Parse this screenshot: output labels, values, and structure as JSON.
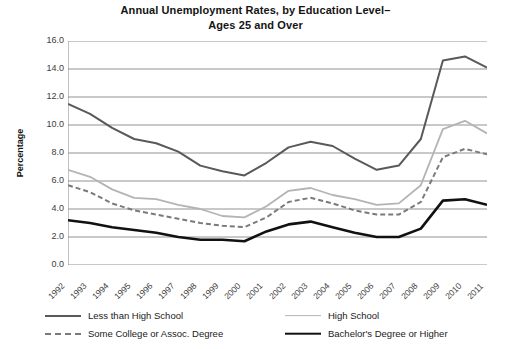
{
  "chart_data": {
    "type": "line",
    "title": "Annual Unemployment Rates, by Education Level– Ages 25 and Over",
    "title_line1": "Annual Unemployment Rates, by Education Level–",
    "title_line2": "Ages 25 and Over",
    "xlabel": "",
    "ylabel": "Percentage",
    "ylim": [
      0.0,
      16.0
    ],
    "ytick_step": 2.0,
    "grid": "horizontal",
    "legend_position": "bottom",
    "yticks": [
      "16.0",
      "14.0",
      "12.0",
      "10.0",
      "8.0",
      "6.0",
      "4.0",
      "2.0",
      "0.0"
    ],
    "categories": [
      "1992",
      "1993",
      "1994",
      "1995",
      "1996",
      "1997",
      "1998",
      "1999",
      "2000",
      "2001",
      "2002",
      "2003",
      "2004",
      "2005",
      "2006",
      "2007",
      "2008",
      "2009",
      "2010",
      "2011"
    ],
    "series": [
      {
        "name": "Less than High School",
        "color": "#595959",
        "style": "solid",
        "width": 2.0,
        "values": [
          11.5,
          10.8,
          9.8,
          9.0,
          8.7,
          8.1,
          7.1,
          6.7,
          6.4,
          7.3,
          8.4,
          8.8,
          8.5,
          7.6,
          6.8,
          7.1,
          9.0,
          14.6,
          14.9,
          14.1
        ]
      },
      {
        "name": "High School",
        "color": "#b4b4b4",
        "style": "solid",
        "width": 1.8,
        "values": [
          6.8,
          6.3,
          5.4,
          4.8,
          4.7,
          4.3,
          4.0,
          3.5,
          3.4,
          4.2,
          5.3,
          5.5,
          5.0,
          4.7,
          4.3,
          4.4,
          5.7,
          9.7,
          10.3,
          9.4
        ]
      },
      {
        "name": "Some College or Assoc. Degree",
        "color": "#7a7a7a",
        "style": "dashed",
        "width": 2.0,
        "values": [
          5.7,
          5.2,
          4.4,
          3.9,
          3.6,
          3.3,
          3.0,
          2.8,
          2.7,
          3.4,
          4.5,
          4.8,
          4.4,
          3.9,
          3.6,
          3.6,
          4.5,
          7.7,
          8.3,
          7.9
        ]
      },
      {
        "name": "Bachelor's Degree or Higher",
        "color": "#111111",
        "style": "solid",
        "width": 2.6,
        "values": [
          3.2,
          3.0,
          2.7,
          2.5,
          2.3,
          2.0,
          1.8,
          1.8,
          1.7,
          2.4,
          2.9,
          3.1,
          2.7,
          2.3,
          2.0,
          2.0,
          2.6,
          4.6,
          4.7,
          4.3
        ]
      }
    ]
  },
  "legend": {
    "items": [
      {
        "label": "Less than High School"
      },
      {
        "label": "High School"
      },
      {
        "label": "Some College or Assoc. Degree"
      },
      {
        "label": "Bachelor's Degree or Higher"
      }
    ]
  }
}
